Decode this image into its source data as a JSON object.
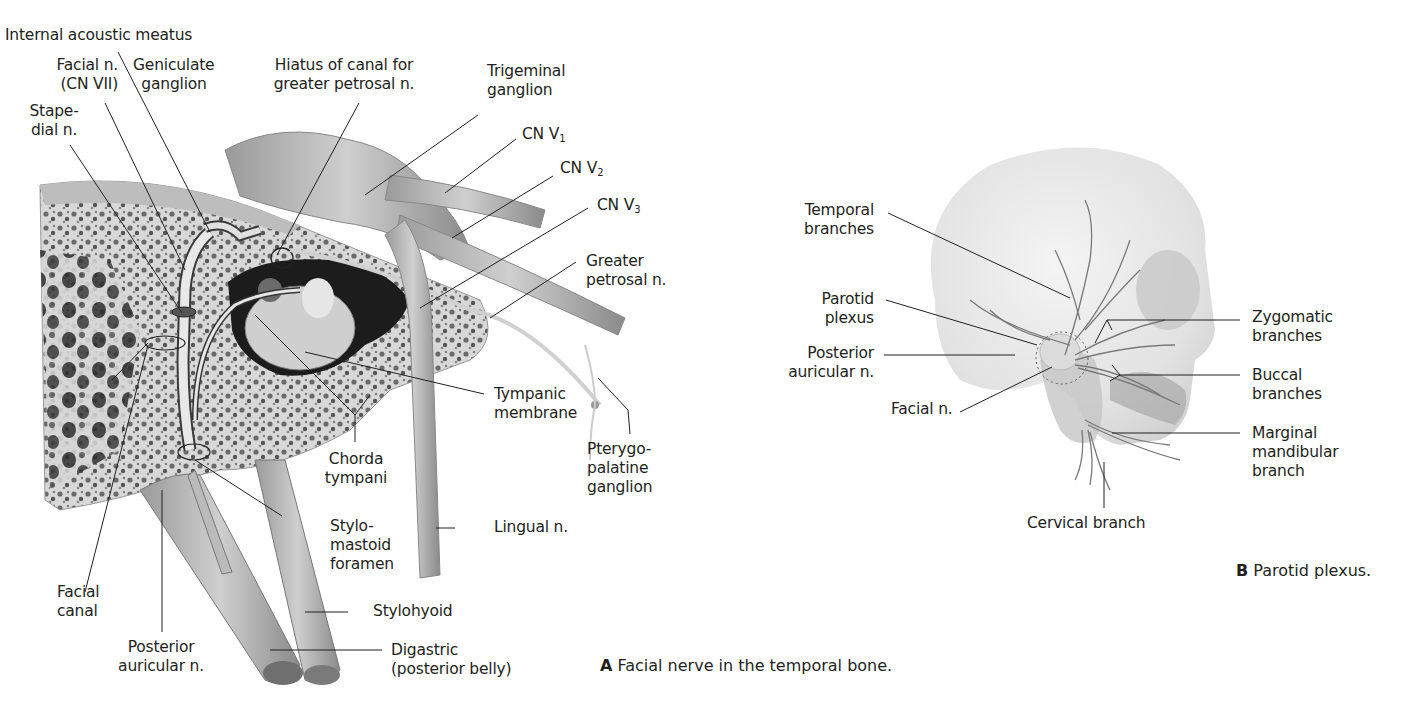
{
  "figure": {
    "panel_a": {
      "caption_letter": "A",
      "caption_text": "Facial nerve in the temporal bone.",
      "labels": {
        "internal_acoustic_meatus": "Internal acoustic meatus",
        "facial_n_1": "Facial n.",
        "facial_n_2": "(CN VII)",
        "geniculate_1": "Geniculate",
        "geniculate_2": "ganglion",
        "stapedial_1": "Stape-",
        "stapedial_2": "dial n.",
        "hiatus_1": "Hiatus of canal for",
        "hiatus_2": "greater petrosal n.",
        "trigeminal_1": "Trigeminal",
        "trigeminal_2": "ganglion",
        "cn_v1": "CN V",
        "cn_v1_sub": "1",
        "cn_v2": "CN V",
        "cn_v2_sub": "2",
        "cn_v3": "CN V",
        "cn_v3_sub": "3",
        "greater_petrosal_1": "Greater",
        "greater_petrosal_2": "petrosal n.",
        "tympanic_1": "Tympanic",
        "tympanic_2": "membrane",
        "pterygo_1": "Pterygo-",
        "pterygo_2": "palatine",
        "pterygo_3": "ganglion",
        "chorda_1": "Chorda",
        "chorda_2": "tympani",
        "stylomastoid_1": "Stylo-",
        "stylomastoid_2": "mastoid",
        "stylomastoid_3": "foramen",
        "lingual": "Lingual n.",
        "facial_canal_1": "Facial",
        "facial_canal_2": "canal",
        "posterior_auricular_1": "Posterior",
        "posterior_auricular_2": "auricular n.",
        "stylohyoid": "Stylohyoid",
        "digastric_1": "Digastric",
        "digastric_2": "(posterior belly)"
      }
    },
    "panel_b": {
      "caption_letter": "B",
      "caption_text": "Parotid plexus.",
      "labels": {
        "temporal_1": "Temporal",
        "temporal_2": "branches",
        "parotid_1": "Parotid",
        "parotid_2": "plexus",
        "posterior_auricular_1": "Posterior",
        "posterior_auricular_2": "auricular n.",
        "facial_n": "Facial n.",
        "zygomatic_1": "Zygomatic",
        "zygomatic_2": "branches",
        "buccal_1": "Buccal",
        "buccal_2": "branches",
        "marginal_1": "Marginal",
        "marginal_2": "mandibular",
        "marginal_3": "branch",
        "cervical": "Cervical branch"
      }
    }
  }
}
